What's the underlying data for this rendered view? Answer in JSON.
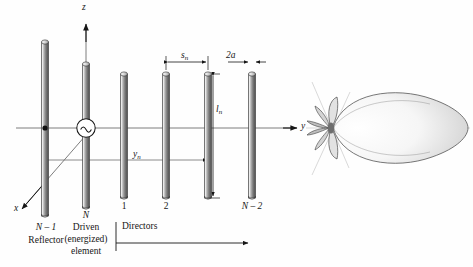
{
  "figure": {
    "type": "yagi-uda-antenna-diagram"
  },
  "axes": {
    "z_label": "z",
    "y_label": "y",
    "x_label": "x"
  },
  "dimensions": {
    "spacing_label": "s",
    "spacing_sub": "n",
    "length_label": "l",
    "length_sub": "n",
    "offset_label": "y",
    "offset_sub": "n",
    "diameter_label": "2a"
  },
  "elements": [
    {
      "index_label": "N – 1",
      "name": "Reflector",
      "role": "reflector",
      "x": 45,
      "top": 40,
      "bottom": 218
    },
    {
      "index_label": "N",
      "name_line1": "Driven",
      "name_line2": "(energized)",
      "name_line3": "element",
      "role": "driven",
      "x": 86,
      "top": 62,
      "bottom": 210
    },
    {
      "index_label": "1",
      "role": "director",
      "x": 124,
      "top": 72,
      "bottom": 200
    },
    {
      "index_label": "2",
      "role": "director",
      "x": 166,
      "top": 72,
      "bottom": 200
    },
    {
      "index_label": "",
      "role": "director",
      "x": 208,
      "top": 72,
      "bottom": 200
    },
    {
      "index_label": "N – 2",
      "role": "director",
      "x": 252,
      "top": 72,
      "bottom": 200
    }
  ],
  "groups": {
    "directors_label": "Directors"
  },
  "source": {
    "symbol": "ac-generator",
    "glyph": "∼"
  },
  "pattern": {
    "type": "radiation-pattern",
    "main_lobe_direction": "+y",
    "center_x": 330,
    "center_y": 128,
    "main_lobe_length": 136,
    "main_lobe_halfwidth": 41,
    "back_lobes": 4
  },
  "colors": {
    "ink": "#161616",
    "rod_light": "#f2f2f2",
    "rod_mid": "#9a9a9a",
    "rod_dark": "#4a4a4a",
    "line": "#6f6f6f",
    "background": "#fefefe"
  }
}
